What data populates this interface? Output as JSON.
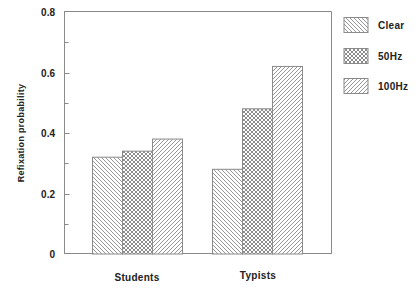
{
  "chart_data": {
    "type": "bar",
    "title": "",
    "xlabel": "",
    "ylabel": "Refixation probability",
    "categories": [
      "Students",
      "Typists"
    ],
    "series": [
      {
        "name": "Clear",
        "values": [
          0.32,
          0.28
        ],
        "pattern": "hatch-backslash"
      },
      {
        "name": "50Hz",
        "values": [
          0.34,
          0.48
        ],
        "pattern": "crosshatch"
      },
      {
        "name": "100Hz",
        "values": [
          0.38,
          0.62
        ],
        "pattern": "hatch-slash"
      }
    ],
    "ylim": [
      0,
      0.8
    ],
    "yticks": [
      0,
      0.2,
      0.4,
      0.6,
      0.8
    ],
    "ytick_labels": [
      "0",
      "0.2",
      "0.4",
      "0.6",
      "0.8"
    ],
    "minor_yticks": [
      0.1,
      0.3,
      0.5,
      0.7
    ],
    "grid": false,
    "legend_position": "right-outside-top",
    "colors": {
      "line": "#8a8a8a",
      "text": "#222222",
      "background": "#ffffff"
    }
  },
  "axis": {
    "ylabel": "Refixation probability",
    "ytick_labels": [
      "0",
      "0.2",
      "0.4",
      "0.6",
      "0.8"
    ]
  },
  "categories": [
    "Students",
    "Typists"
  ],
  "legend": {
    "items": [
      {
        "label": "Clear"
      },
      {
        "label": "50Hz"
      },
      {
        "label": "100Hz"
      }
    ]
  }
}
